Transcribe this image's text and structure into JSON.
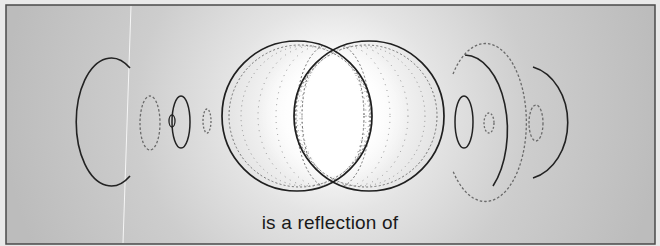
{
  "diagram": {
    "caption": "is a reflection of",
    "colors": {
      "background_edge": "#bdbdbd",
      "background_center": "#ffffff",
      "frame": "#4a4a4a",
      "solid_line": "#1f1f1f",
      "dashed_line": "#6a6a6a",
      "dotted_line": "#7a7a7a",
      "scan_line": "#f4f4f4"
    },
    "left_group": [
      "large-c-arc",
      "dashed-ellipse",
      "solid-ellipse",
      "tiny-ellipse",
      "small-dashed-ellipse"
    ],
    "center_group": [
      "left-large-circle",
      "right-large-circle",
      "dotted-concentric-rings",
      "central-glow"
    ],
    "right_group": [
      "solid-ellipse",
      "small-dashed-ellipse",
      "large-solid-arc",
      "large-dashed-arc",
      "dashed-ellipse",
      "reversed-c-arc"
    ]
  }
}
